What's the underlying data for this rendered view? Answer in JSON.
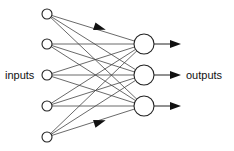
{
  "diagram": {
    "title": "",
    "type": "feedforward-neural-network",
    "labels": {
      "inputs": "inputs",
      "outputs": "outputs"
    },
    "colors": {
      "stroke": "#222222",
      "edge": "#444444",
      "node_fill": "#ffffff",
      "background": "#ffffff"
    },
    "layers": [
      {
        "name": "input",
        "count": 5,
        "x": 47,
        "radius": 5,
        "y": [
          14,
          44,
          75,
          106,
          137
        ]
      },
      {
        "name": "output-neurons",
        "count": 3,
        "x": 144,
        "radius": 10,
        "y": [
          44,
          75,
          106
        ]
      }
    ],
    "connections": "fully-connected",
    "edge_arrowheads": [
      {
        "from_input": 0,
        "to_node": 0,
        "at": [
          100,
          28
        ]
      },
      {
        "from_input": 4,
        "to_node": 2,
        "at": [
          100,
          122
        ]
      }
    ],
    "output_arrows": {
      "x_start": 154,
      "x_end": 181
    }
  }
}
